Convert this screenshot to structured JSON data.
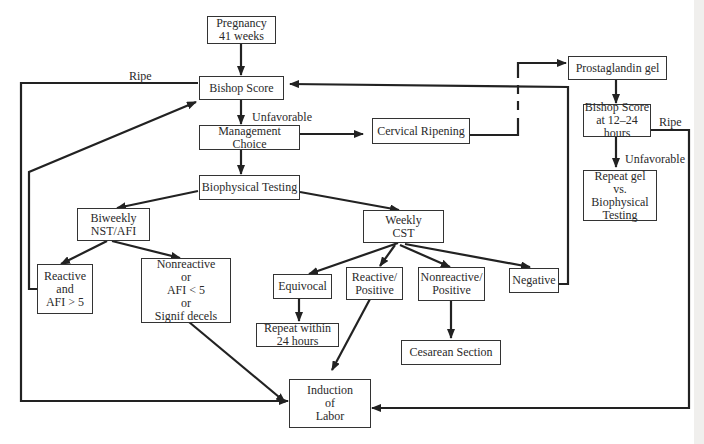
{
  "nodes": {
    "pregnancy": "Pregnancy\n41 weeks",
    "bishop": "Bishop Score",
    "management": "Management Choice",
    "cervical": "Cervical Ripening",
    "prostaglandin": "Prostaglandin gel",
    "bishop12": "Bishop Score\nat 12–24\nhours",
    "repeatgel": "Repeat gel\nvs.\nBiophysical\nTesting",
    "biophysical": "Biophysical Testing",
    "biweekly": "Biweekly\nNST/AFI",
    "weekly": "Weekly\nCST",
    "reactive_afi": "Reactive\nand\nAFI > 5",
    "nonreactive_afi": "Nonreactive\nor\nAFI < 5\nor\nSignif decels",
    "equivocal": "Equivocal",
    "reactive_pos": "Reactive/\nPositive",
    "nonreactive_pos": "Nonreactive/\nPositive",
    "negative": "Negative",
    "repeat24": "Repeat within\n24 hours",
    "cesarean": "Cesarean Section",
    "induction": "Induction\nof\nLabor"
  },
  "labels": {
    "ripe_left": "Ripe",
    "unfavorable_main": "Unfavorable",
    "ripe_right": "Ripe",
    "unfavorable_right": "Unfavorable"
  },
  "colors": {
    "line": "#222222",
    "box_border": "#333333",
    "background": "#ffffff"
  }
}
